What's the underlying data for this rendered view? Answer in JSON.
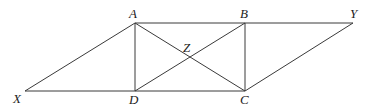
{
  "diagram": {
    "type": "geometry",
    "points": [
      "A",
      "B",
      "Y",
      "X",
      "D",
      "C",
      "Z"
    ],
    "labels": {
      "A": "A",
      "B": "B",
      "Y": "Y",
      "X": "X",
      "D": "D",
      "C": "C",
      "Z": "Z"
    },
    "segments": [
      [
        "A",
        "Y"
      ],
      [
        "X",
        "C"
      ],
      [
        "X",
        "A"
      ],
      [
        "A",
        "D"
      ],
      [
        "B",
        "C"
      ],
      [
        "Y",
        "C"
      ],
      [
        "A",
        "C"
      ],
      [
        "B",
        "D"
      ]
    ],
    "intersections": [
      {
        "point": "Z",
        "of": [
          [
            "A",
            "C"
          ],
          [
            "B",
            "D"
          ]
        ]
      }
    ],
    "colors": {
      "line": "#3a3a3a",
      "label": "#222222"
    }
  }
}
